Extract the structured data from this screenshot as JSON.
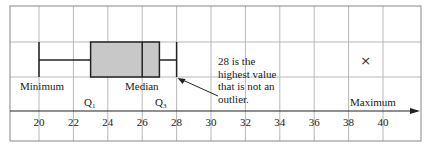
{
  "chart_data": {
    "type": "boxplot",
    "title": "",
    "xlabel": "",
    "ylabel": "",
    "xlim": [
      18.8,
      42.2
    ],
    "ticks": [
      20,
      22,
      24,
      26,
      28,
      30,
      32,
      34,
      36,
      38,
      40
    ],
    "grid": true,
    "box": {
      "minimum": 20,
      "q1": 23,
      "median": 26,
      "q3": 27,
      "upper_whisker": 28
    },
    "outliers": [
      39
    ],
    "labels": {
      "minimum": "Minimum",
      "q1": "Q",
      "q1_sub": "1",
      "median": "Median",
      "q3": "Q",
      "q3_sub": "3",
      "maximum": "Maximum"
    },
    "annotation": {
      "text": "28 is the\nhighest value\nthat is not an\noutlier.",
      "points_to": 28
    },
    "colors": {
      "box_fill": "#c8c8c8",
      "lines": "#222222",
      "grid": "#b8b8b8"
    }
  }
}
